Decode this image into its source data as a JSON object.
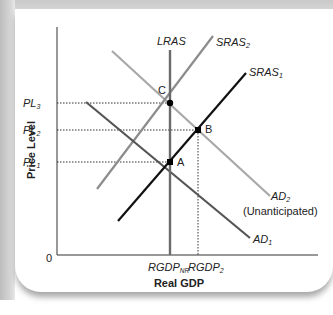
{
  "diagram": {
    "title": "",
    "axes": {
      "x_label": "Real GDP",
      "y_label": "Price Level",
      "origin_label": "0"
    },
    "price_levels": [
      {
        "id": "PL3",
        "base": "PL",
        "sub": "3"
      },
      {
        "id": "PL2",
        "base": "PL",
        "sub": "2"
      },
      {
        "id": "PL1",
        "base": "PL",
        "sub": "1"
      }
    ],
    "output_levels": [
      {
        "id": "RGDP_NR",
        "base": "RGDP",
        "sub": "NR"
      },
      {
        "id": "RGDP2",
        "base": "RGDP",
        "sub": "2"
      }
    ],
    "curves": {
      "lras": {
        "label": "LRAS",
        "color": "#6b6b6b"
      },
      "sras1": {
        "base": "SRAS",
        "sub": "1",
        "color": "#111111"
      },
      "sras2": {
        "base": "SRAS",
        "sub": "2",
        "color": "#8c8c8c"
      },
      "ad1": {
        "base": "AD",
        "sub": "1",
        "color": "#555555"
      },
      "ad2": {
        "base": "AD",
        "sub": "2",
        "note": "(Unanticipated)",
        "color": "#a8a8a8"
      }
    },
    "points": [
      {
        "id": "A",
        "label": "A"
      },
      {
        "id": "B",
        "label": "B"
      },
      {
        "id": "C",
        "label": "C"
      }
    ]
  }
}
